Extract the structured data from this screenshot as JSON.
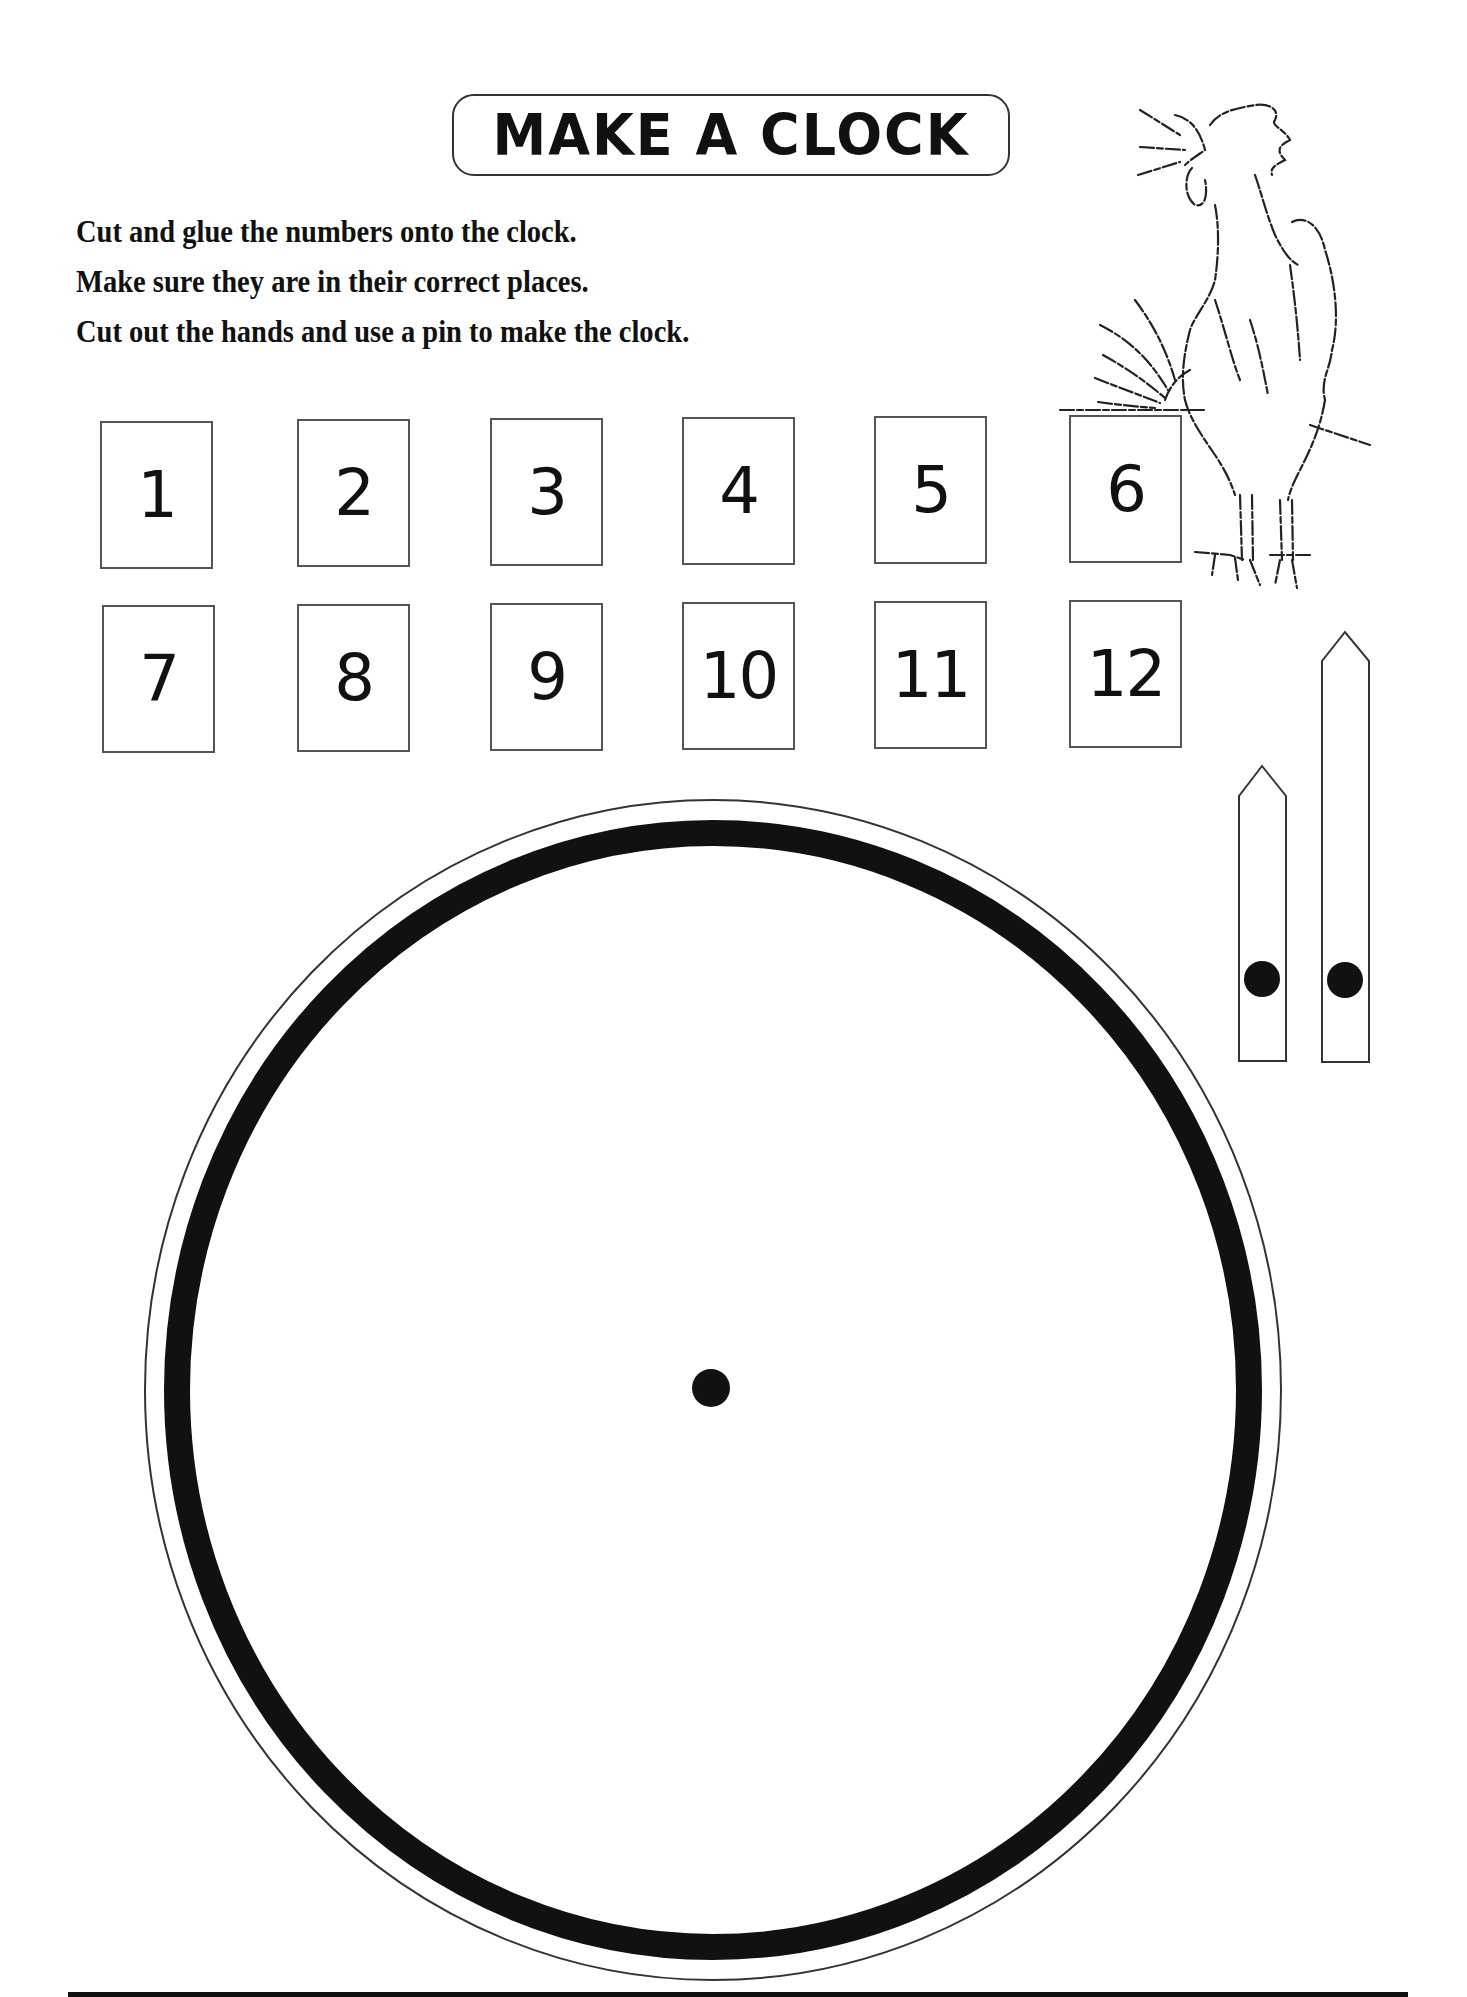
{
  "worksheet": {
    "title": "MAKE A CLOCK",
    "instructions": [
      "Cut and glue the numbers onto the clock.",
      "Make sure they are in their correct places.",
      "Cut out the hands and use a pin to make the clock."
    ],
    "number_cards": [
      {
        "label": "1",
        "x": 100,
        "y": 421
      },
      {
        "label": "2",
        "x": 297,
        "y": 419
      },
      {
        "label": "3",
        "x": 490,
        "y": 418
      },
      {
        "label": "4",
        "x": 682,
        "y": 417
      },
      {
        "label": "5",
        "x": 874,
        "y": 416
      },
      {
        "label": "6",
        "x": 1069,
        "y": 415
      },
      {
        "label": "7",
        "x": 102,
        "y": 605
      },
      {
        "label": "8",
        "x": 297,
        "y": 604
      },
      {
        "label": "9",
        "x": 490,
        "y": 603
      },
      {
        "label": "10",
        "x": 682,
        "y": 602
      },
      {
        "label": "11",
        "x": 874,
        "y": 601
      },
      {
        "label": "12",
        "x": 1069,
        "y": 600
      }
    ],
    "clock_hands": [
      {
        "name": "hour-hand",
        "length": "short"
      },
      {
        "name": "minute-hand",
        "length": "long"
      }
    ],
    "illustration": "rooster-crowing",
    "colors": {
      "ink": "#111111",
      "paper": "#ffffff",
      "border": "#555555"
    }
  }
}
